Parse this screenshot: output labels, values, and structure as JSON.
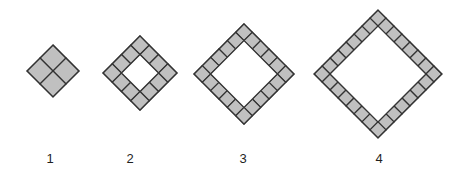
{
  "canvas": {
    "width": 464,
    "height": 178,
    "background_color": "#ffffff"
  },
  "style": {
    "tile_fill": "#c0c0c0",
    "tile_stroke": "#333333",
    "tile_stroke_width": 1.2,
    "label_color": "#1f1f1f",
    "label_font_size": 13,
    "hole_fill": "#ffffff"
  },
  "chart_data": {
    "type": "diagram",
    "title": "",
    "figures": [
      {
        "label": "1",
        "step": 1,
        "outer_grid": 2,
        "inner_hole_grid": 0,
        "tile_count": 4,
        "center_x": 53,
        "center_y": 71,
        "tile_size": 18.4,
        "label_x": 50,
        "label_y": 163
      },
      {
        "label": "2",
        "step": 2,
        "outer_grid": 4,
        "inner_hole_grid": 2,
        "tile_count": 12,
        "center_x": 140,
        "center_y": 73,
        "tile_size": 13.1,
        "label_x": 130,
        "label_y": 163
      },
      {
        "label": "3",
        "step": 3,
        "outer_grid": 6,
        "inner_hole_grid": 4,
        "tile_count": 20,
        "center_x": 244,
        "center_y": 74,
        "tile_size": 11.8,
        "label_x": 243,
        "label_y": 163
      },
      {
        "label": "4",
        "step": 4,
        "outer_grid": 8,
        "inner_hole_grid": 6,
        "tile_count": 28,
        "center_x": 378,
        "center_y": 74,
        "tile_size": 11.3,
        "label_x": 379,
        "label_y": 163
      }
    ],
    "labels": [
      "1",
      "2",
      "3",
      "4"
    ],
    "tile_counts": [
      4,
      12,
      20,
      28
    ]
  }
}
